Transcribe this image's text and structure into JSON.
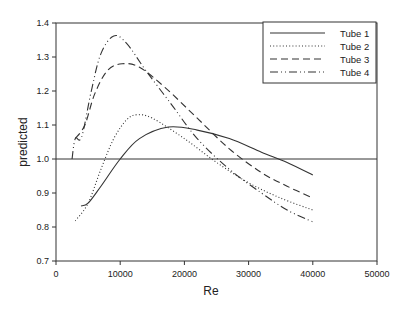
{
  "chart_data": {
    "type": "line",
    "title": "",
    "xlabel": "Re",
    "ylabel": "predicted",
    "xlim": [
      0,
      50000
    ],
    "ylim": [
      0.7,
      1.4
    ],
    "x_ticks": [
      "0",
      "10000",
      "20000",
      "30000",
      "40000",
      "50000"
    ],
    "y_ticks": [
      "0.7",
      "0.8",
      "0.9",
      "1.0",
      "1.1",
      "1.2",
      "1.3",
      "1.4"
    ],
    "grid": false,
    "reference_line": {
      "y": 1.0
    },
    "legend_position": "upper right",
    "series": [
      {
        "name": "Tube 1",
        "style": "solid",
        "x": [
          3900,
          5000,
          7000,
          10000,
          13000,
          17500,
          22000,
          27000,
          32000,
          36000,
          40000
        ],
        "y": [
          0.862,
          0.87,
          0.92,
          1.0,
          1.06,
          1.094,
          1.085,
          1.06,
          1.02,
          0.99,
          0.953
        ]
      },
      {
        "name": "Tube 2",
        "style": "dotted",
        "x": [
          3000,
          5000,
          7000,
          9000,
          11000,
          12600,
          15000,
          20000,
          25000,
          30000,
          35000,
          40000
        ],
        "y": [
          0.818,
          0.87,
          0.97,
          1.06,
          1.115,
          1.13,
          1.12,
          1.06,
          0.99,
          0.93,
          0.885,
          0.85
        ]
      },
      {
        "name": "Tube 3",
        "style": "dashed",
        "x": [
          3000,
          4500,
          6000,
          8000,
          10300,
          13000,
          17000,
          22000,
          27000,
          32000,
          36000,
          40000
        ],
        "y": [
          1.06,
          1.1,
          1.19,
          1.26,
          1.28,
          1.27,
          1.21,
          1.12,
          1.03,
          0.96,
          0.92,
          0.885
        ]
      },
      {
        "name": "Tube 4",
        "style": "dashdot",
        "x": [
          2500,
          3000,
          4000,
          5500,
          7000,
          9000,
          11000,
          14000,
          18000,
          22000,
          27000,
          32000,
          36000,
          40000
        ],
        "y": [
          1.0,
          1.06,
          1.065,
          1.2,
          1.31,
          1.362,
          1.34,
          1.26,
          1.16,
          1.06,
          0.97,
          0.9,
          0.85,
          0.815
        ]
      }
    ]
  }
}
